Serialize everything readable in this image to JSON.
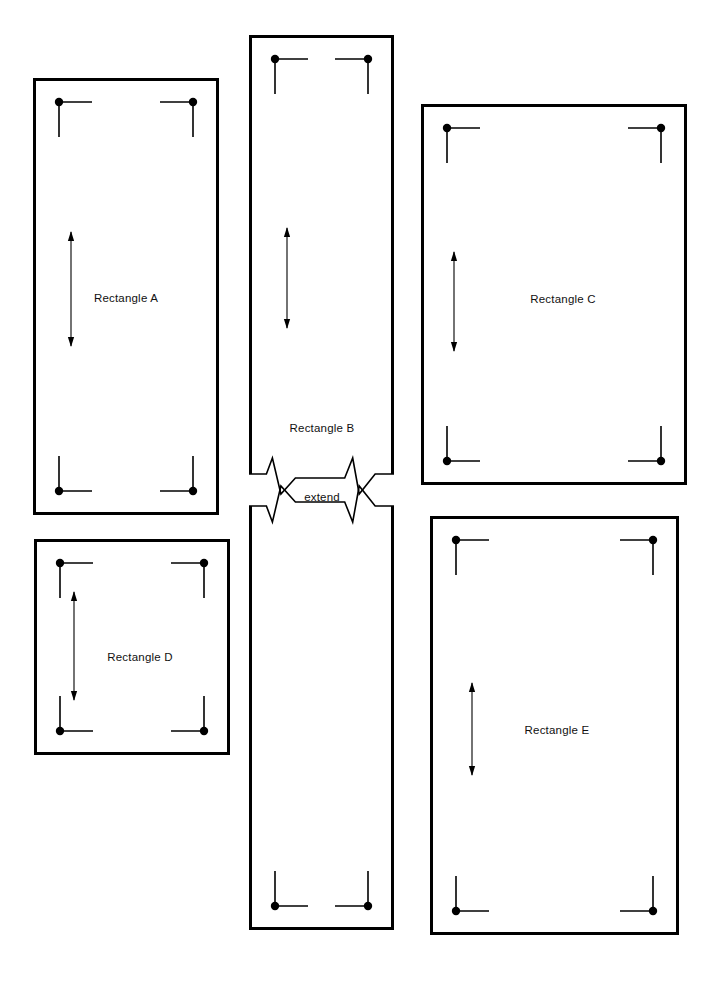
{
  "diagram": {
    "background_color": "#ffffff",
    "line_color": "#000000",
    "text_color": "#111111",
    "border_width_px": 3,
    "canvas": {
      "width": 718,
      "height": 984
    }
  },
  "icons": {
    "corner_marker": "corner-bracket-icon",
    "dimension_arrow": "double-headed-arrow-icon",
    "break_symbol": "zigzag-break-icon"
  },
  "rectangles": [
    {
      "id": "a",
      "label": "Rectangle A",
      "x": 33,
      "y": 78,
      "width": 186,
      "height": 437,
      "label_x": 126,
      "label_y": 298,
      "arrow": {
        "x": 71,
        "y1": 232,
        "y2": 346
      },
      "corners": [
        "top-left",
        "top-right",
        "bottom-left",
        "bottom-right"
      ],
      "broken": false
    },
    {
      "id": "b",
      "label": "Rectangle B",
      "x": 249,
      "y": 35,
      "width": 145,
      "height": 895,
      "label_x": 322,
      "label_y": 428,
      "arrow": {
        "x": 287,
        "y1": 228,
        "y2": 328
      },
      "corners": [
        "top-left",
        "top-right",
        "bottom-left",
        "bottom-right"
      ],
      "broken": true,
      "break": {
        "y_top": 474,
        "y_bottom": 506,
        "label": "extend",
        "label_x": 322,
        "label_y": 497
      }
    },
    {
      "id": "c",
      "label": "Rectangle C",
      "x": 421,
      "y": 104,
      "width": 266,
      "height": 381,
      "label_x": 563,
      "label_y": 299,
      "arrow": {
        "x": 454,
        "y1": 252,
        "y2": 351
      },
      "corners": [
        "top-left",
        "top-right",
        "bottom-left",
        "bottom-right"
      ],
      "broken": false
    },
    {
      "id": "d",
      "label": "Rectangle D",
      "x": 34,
      "y": 539,
      "width": 196,
      "height": 216,
      "label_x": 140,
      "label_y": 657,
      "arrow": {
        "x": 74,
        "y1": 592,
        "y2": 700
      },
      "corners": [
        "top-left",
        "top-right",
        "bottom-left",
        "bottom-right"
      ],
      "broken": false
    },
    {
      "id": "e",
      "label": "Rectangle E",
      "x": 430,
      "y": 516,
      "width": 249,
      "height": 419,
      "label_x": 557,
      "label_y": 730,
      "arrow": {
        "x": 472,
        "y1": 683,
        "y2": 775
      },
      "corners": [
        "top-left",
        "top-right",
        "bottom-left",
        "bottom-right"
      ],
      "broken": false
    }
  ],
  "corner_marker_geometry": {
    "inset_x": 26,
    "inset_y": 24,
    "arm_horizontal": 33,
    "arm_vertical": 35,
    "dot_radius": 4.2,
    "stroke_width": 1.6
  },
  "labels_all": [
    "Rectangle A",
    "Rectangle B",
    "Rectangle C",
    "Rectangle D",
    "Rectangle E",
    "extend"
  ]
}
